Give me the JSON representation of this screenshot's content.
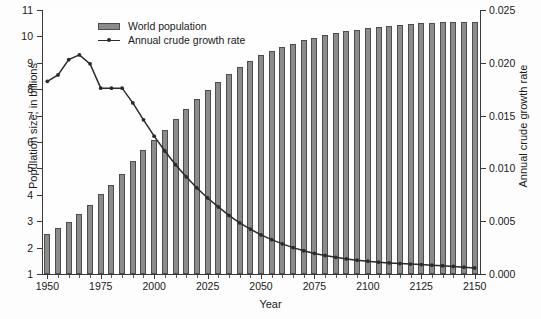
{
  "chart_data": {
    "type": "bar",
    "title": "",
    "xlabel": "Year",
    "ylabel": "Population size, in billions",
    "y2label": "Annual crude growth rate",
    "grid": false,
    "legend_position": "top-left-inside",
    "ylim": [
      1,
      11
    ],
    "y2lim": [
      0.0,
      0.025
    ],
    "xlim": [
      1947.5,
      2152.5
    ],
    "yticks": [
      "1",
      "2",
      "3",
      "4",
      "5",
      "6",
      "7",
      "8",
      "9",
      "10",
      "11"
    ],
    "ytick_values": [
      1,
      2,
      3,
      4,
      5,
      6,
      7,
      8,
      9,
      10,
      11
    ],
    "y2ticks": [
      "0.000",
      "0.005",
      "0.010",
      "0.015",
      "0.020",
      "0.025"
    ],
    "y2tick_values": [
      0.0,
      0.005,
      0.01,
      0.015,
      0.02,
      0.025
    ],
    "xticks": [
      "1950",
      "1975",
      "2000",
      "2025",
      "2050",
      "2075",
      "2100",
      "2125",
      "2150"
    ],
    "xtick_values": [
      1950,
      1975,
      2000,
      2025,
      2050,
      2075,
      2100,
      2125,
      2150
    ],
    "categories": [
      1950,
      1955,
      1960,
      1965,
      1970,
      1975,
      1980,
      1985,
      1990,
      1995,
      2000,
      2005,
      2010,
      2015,
      2020,
      2025,
      2030,
      2035,
      2040,
      2045,
      2050,
      2055,
      2060,
      2065,
      2070,
      2075,
      2080,
      2085,
      2090,
      2095,
      2100,
      2105,
      2110,
      2115,
      2120,
      2125,
      2130,
      2135,
      2140,
      2145,
      2150
    ],
    "series": [
      {
        "name": "World population",
        "axis": "left",
        "type": "bar",
        "color": "#8b8b8b",
        "edge_color": "#4d4d4d",
        "values": [
          2.52,
          2.74,
          2.98,
          3.27,
          3.63,
          4.02,
          4.39,
          4.79,
          5.27,
          5.68,
          6.07,
          6.45,
          6.88,
          7.25,
          7.62,
          7.97,
          8.29,
          8.58,
          8.85,
          9.08,
          9.28,
          9.45,
          9.6,
          9.73,
          9.85,
          9.95,
          10.04,
          10.12,
          10.19,
          10.25,
          10.3,
          10.35,
          10.39,
          10.43,
          10.46,
          10.49,
          10.51,
          10.53,
          10.54,
          10.55,
          10.56
        ]
      },
      {
        "name": "Annual crude growth rate",
        "axis": "right",
        "type": "line",
        "color": "#2b2b2b",
        "marker": "filled-circle",
        "values": [
          0.01825,
          0.01885,
          0.0203,
          0.02075,
          0.0199,
          0.0176,
          0.0176,
          0.0176,
          0.0162,
          0.0146,
          0.01305,
          0.01165,
          0.01035,
          0.0092,
          0.00815,
          0.0072,
          0.00635,
          0.00555,
          0.00485,
          0.00425,
          0.0037,
          0.00325,
          0.00285,
          0.0025,
          0.0022,
          0.00195,
          0.00175,
          0.00158,
          0.00143,
          0.00131,
          0.00121,
          0.00112,
          0.00105,
          0.00099,
          0.00094,
          0.00089,
          0.00084,
          0.00078,
          0.00072,
          0.00065,
          0.00058
        ]
      }
    ]
  },
  "legend": {
    "items": [
      {
        "label": "World population",
        "marker": "bar-swatch"
      },
      {
        "label": "Annual crude growth rate",
        "marker": "line-with-dot"
      }
    ]
  },
  "colors": {
    "bar_fill": "#8b8b8b",
    "bar_edge": "#4d4d4d",
    "line": "#2b2b2b",
    "axis": "#3a3a3a",
    "background": "#fdfdfd",
    "text": "#1a1a1a"
  }
}
